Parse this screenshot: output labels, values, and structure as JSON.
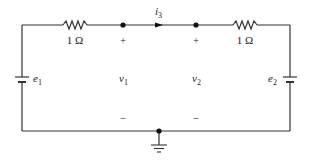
{
  "diagram": {
    "type": "circuit",
    "colors": {
      "wire": "#333333",
      "text": "#222222",
      "background": "#ffffff"
    },
    "resistors": [
      {
        "id": "R1",
        "label": "1 Ω"
      },
      {
        "id": "R2",
        "label": "1 Ω"
      }
    ],
    "sources": [
      {
        "id": "e1",
        "label": "e",
        "subscript": "1"
      },
      {
        "id": "e2",
        "label": "e",
        "subscript": "2"
      }
    ],
    "current": {
      "label": "i",
      "subscript": "3"
    },
    "node_voltages": [
      {
        "label": "v",
        "subscript": "1",
        "plus": "+",
        "minus": "–"
      },
      {
        "label": "v",
        "subscript": "2",
        "plus": "+",
        "minus": "–"
      }
    ],
    "ground": {
      "symbol": "ground-icon"
    }
  }
}
